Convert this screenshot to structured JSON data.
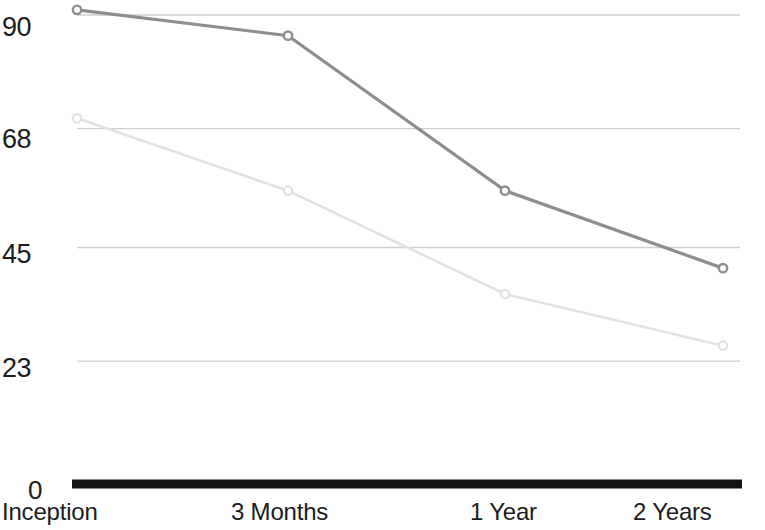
{
  "chart_data": {
    "type": "line",
    "title": "",
    "subtitle": "",
    "xlabel": "",
    "ylabel": "",
    "categories": [
      "Inception",
      "3 Months",
      "1 Year",
      "2 Years"
    ],
    "yticklabels": [
      "90",
      "68",
      "45",
      "23",
      "0"
    ],
    "ytickvalues": [
      90,
      68,
      45,
      23,
      0
    ],
    "ylim": [
      0,
      90
    ],
    "grid": true,
    "grid_axis": "y",
    "legend": "none",
    "series": [
      {
        "name": "series-1",
        "color": "#8d8d8d",
        "marker": "open-circle",
        "values": [
          91,
          86,
          56,
          41
        ]
      },
      {
        "name": "series-2",
        "color": "#e2e2e2",
        "marker": "open-circle",
        "values": [
          70,
          56,
          36,
          26
        ]
      }
    ],
    "colors": {
      "gridline": "#cfcfcf",
      "axis": "#121212",
      "text": "#1c1c1c",
      "background": "#ffffff"
    }
  },
  "axis": {
    "y_ticks": [
      {
        "label": "90"
      },
      {
        "label": "68"
      },
      {
        "label": "45"
      },
      {
        "label": "23"
      },
      {
        "label": "0"
      }
    ],
    "x_ticks": [
      {
        "label": "Inception"
      },
      {
        "label": "3 Months"
      },
      {
        "label": "1 Year"
      },
      {
        "label": "2 Years"
      }
    ]
  }
}
